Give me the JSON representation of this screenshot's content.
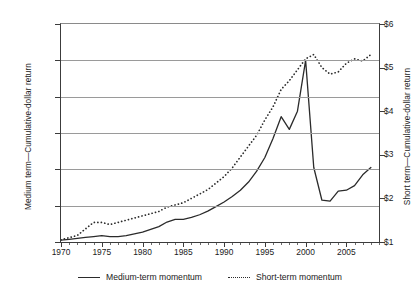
{
  "chart_data": {
    "type": "line",
    "title": "",
    "xlabel": "",
    "ylabel": "Medium term—Cumulative-dollar return",
    "ylabel_right": "Short term—Cumulative-dollar return",
    "grid": true,
    "legend_position": "bottom",
    "xlim": [
      1970,
      2009
    ],
    "ylim": [
      0,
      120
    ],
    "ylim_right": [
      1,
      6
    ],
    "xticks": [
      "1970",
      "1975",
      "1980",
      "1985",
      "1990",
      "1995",
      "2000",
      "2005"
    ],
    "xtick_values": [
      1970,
      1975,
      1980,
      1985,
      1990,
      1995,
      2000,
      2005
    ],
    "yticks_left": [
      "$0",
      "$20",
      "$40",
      "$60",
      "$80",
      "$100",
      "$120"
    ],
    "ytick_values_left": [
      0,
      20,
      40,
      60,
      80,
      100,
      120
    ],
    "yticks_right": [
      "$1",
      "$2",
      "$3",
      "$4",
      "$5",
      "$6"
    ],
    "ytick_values_right": [
      1,
      2,
      3,
      4,
      5,
      6
    ],
    "x": [
      1970,
      1971,
      1972,
      1973,
      1974,
      1975,
      1976,
      1977,
      1978,
      1979,
      1980,
      1981,
      1982,
      1983,
      1984,
      1985,
      1986,
      1987,
      1988,
      1989,
      1990,
      1991,
      1992,
      1993,
      1994,
      1995,
      1996,
      1997,
      1998,
      1999,
      2000,
      2001,
      2002,
      2003,
      2004,
      2005,
      2006,
      2007,
      2008
    ],
    "series": [
      {
        "name": "Medium-term momentum",
        "axis": "left",
        "style": "solid",
        "color": "#2b2b2b",
        "values": [
          1,
          1.5,
          2,
          2.5,
          3,
          3.5,
          3,
          3,
          3.5,
          4.5,
          5.5,
          7,
          8.5,
          11,
          12.5,
          12.5,
          13.5,
          15,
          17,
          19.5,
          22,
          25,
          28.5,
          33,
          39,
          46.5,
          57,
          69,
          62,
          72,
          100,
          41,
          23,
          22.5,
          28,
          28.5,
          31,
          37,
          41
        ]
      },
      {
        "name": "Short-term momentum",
        "axis": "right",
        "style": "dotted",
        "color": "#2b2b2b",
        "values": [
          1.05,
          1.1,
          1.15,
          1.3,
          1.45,
          1.45,
          1.4,
          1.45,
          1.5,
          1.55,
          1.6,
          1.65,
          1.7,
          1.8,
          1.85,
          1.9,
          2.0,
          2.1,
          2.2,
          2.35,
          2.5,
          2.7,
          2.95,
          3.2,
          3.45,
          3.8,
          4.1,
          4.5,
          4.7,
          4.95,
          5.2,
          5.3,
          5.0,
          4.85,
          4.9,
          5.1,
          5.2,
          5.15,
          5.3
        ]
      }
    ]
  },
  "legend": {
    "items": [
      {
        "label": "Medium-term momentum",
        "style": "solid"
      },
      {
        "label": "Short-term momentum",
        "style": "dotted"
      }
    ]
  }
}
